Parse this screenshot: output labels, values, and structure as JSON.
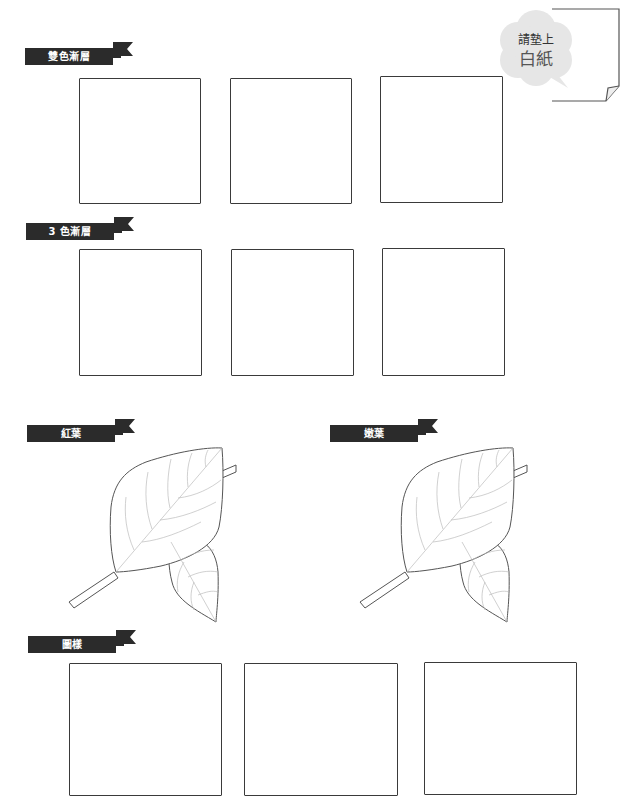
{
  "page": {
    "background": "#ffffff",
    "ribbon_color": "#2b2b2b",
    "line_color": "#3a3a3a"
  },
  "note": {
    "line1": "請墊上",
    "line2": "白紙",
    "cloud_color": "#e6e6e6"
  },
  "sections": [
    {
      "id": "two-color-gradient",
      "label": "雙色漸層",
      "box_count": 3
    },
    {
      "id": "three-color-gradient",
      "label": "3 色漸層",
      "box_count": 3
    },
    {
      "id": "red-leaves",
      "label": "紅葉",
      "illustration": "leaf-pair"
    },
    {
      "id": "young-leaves",
      "label": "嫩葉",
      "illustration": "leaf-pair"
    },
    {
      "id": "patterns",
      "label": "圖樣",
      "box_count": 3
    }
  ]
}
